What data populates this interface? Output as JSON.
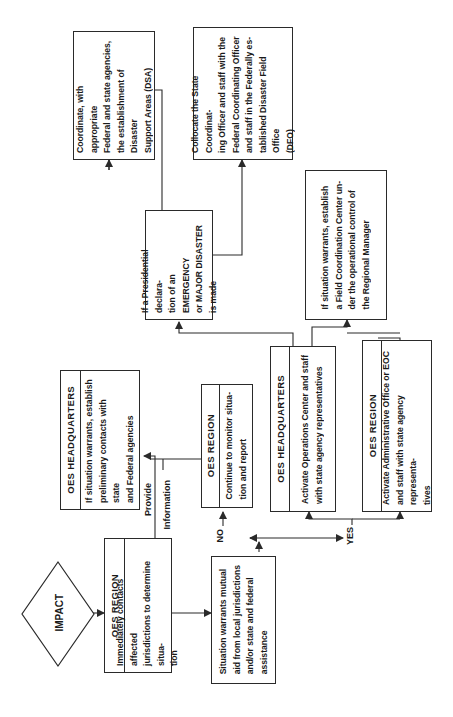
{
  "diagram": {
    "type": "flowchart",
    "orientation": "rotated-90-ccw",
    "start": {
      "label": "IMPACT"
    },
    "boxes": {
      "oes_region_initial": {
        "header": "OES REGION",
        "text": "Immediately contacts affected\njurisdictions to determine situa-\ntion"
      },
      "situation_warrants": {
        "text": "Situation warrants mutual\naid from local jurisdictions\nand/or state and federal\nassistance"
      },
      "oes_hq_preliminary": {
        "header": "OES HEADQUARTERS",
        "text": "If situation warrants, establish\npreliminary contacts with state\nand Federal agencies"
      },
      "oes_region_monitor": {
        "header": "OES REGION",
        "text": "Continue to monitor situa-\ntion and report"
      },
      "oes_hq_activate": {
        "header": "OES HEADQUARTERS",
        "text": "Activate Operations Center and staff\nwith state agency representatives"
      },
      "oes_region_activate": {
        "header": "OES REGION",
        "text": "Activate Administrative Office or EOC\nand staff with state agency representa-\ntives"
      },
      "presidential_declaration": {
        "text": "If a Presidential declara-\ntion of an EMERGENCY\nor MAJOR DISASTER\nis made"
      },
      "field_coordination": {
        "text": "If situation warrants, establish\na Field Coordination Center un-\nder the operational control of\nthe Regional Manager"
      },
      "coordinate_dsa": {
        "text": "Coordinate, with appropriate\nFederal and state agencies,\nthe establishment of Disaster\nSupport Areas (DSA)"
      },
      "collocate_dfo": {
        "text": "Collocate the State Coordinat-\ning Officer and staff with the\nFederal Coordinating Officer\nand staff in the Federally es-\ntablished Disaster Field Office\n(DFO)"
      }
    },
    "labels": {
      "provide": "Provide",
      "information": "Information",
      "no": "NO",
      "yes": "YES"
    },
    "colors": {
      "line": "#2a2a2a",
      "background": "#ffffff"
    }
  }
}
